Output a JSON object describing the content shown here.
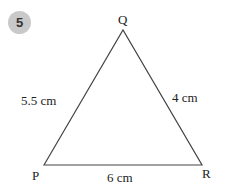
{
  "question_number": "5",
  "triangle": {
    "vertices": {
      "P": {
        "label": "P",
        "x": 44,
        "y": 165
      },
      "Q": {
        "label": "Q",
        "x": 123,
        "y": 30
      },
      "R": {
        "label": "R",
        "x": 202,
        "y": 165
      }
    },
    "sides": {
      "PQ": "5.5 cm",
      "QR": "4 cm",
      "PR": "6 cm"
    }
  },
  "colors": {
    "line": "#444444",
    "badge": "#c9c9c9"
  }
}
